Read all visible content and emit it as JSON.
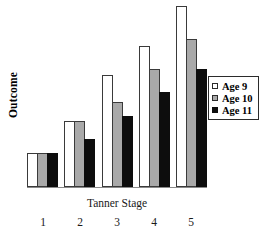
{
  "chart_data": {
    "type": "bar",
    "title": "",
    "xlabel": "Tanner Stage",
    "ylabel": "Outcome",
    "categories": [
      "1",
      "2",
      "3",
      "4",
      "5"
    ],
    "series": [
      {
        "name": "Age 9",
        "color": "#ffffff",
        "swatch": "white-square-icon",
        "values": [
          18.6,
          36.2,
          62.1,
          78.0,
          100.0
        ]
      },
      {
        "name": "Age 10",
        "color": "#a9a9a9",
        "swatch": "gray-square-icon",
        "values": [
          18.6,
          36.2,
          46.9,
          65.0,
          81.9
        ]
      },
      {
        "name": "Age 11",
        "color": "#0d0d0d",
        "swatch": "black-square-icon",
        "values": [
          18.6,
          26.6,
          39.5,
          52.5,
          65.0
        ]
      }
    ],
    "ylim": [
      0,
      100
    ],
    "y_ticks": [],
    "grid": false,
    "axis_lines": {
      "x": true,
      "y": false
    },
    "legend": {
      "position": "right",
      "bordered": true
    }
  },
  "axes": {
    "y_title": "Outcome",
    "x_title": "Tanner Stage"
  },
  "legend": {
    "entries": [
      {
        "label": "Age 9"
      },
      {
        "label": "Age 10"
      },
      {
        "label": "Age 11"
      }
    ]
  }
}
